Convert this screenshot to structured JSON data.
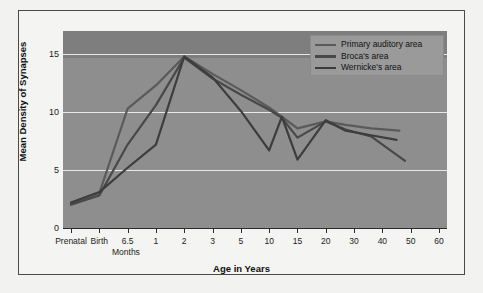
{
  "figure": {
    "background": "#f2f2f0",
    "border_color": "#4a4a4a"
  },
  "chart_data": {
    "type": "line",
    "title": "",
    "xlabel": "Age in Years",
    "ylabel": "Mean Density of Synapses",
    "secondary_xlabel": "Months",
    "plot_background": "#8e8e8e",
    "grid": true,
    "grid_color": "#e8e8e6",
    "legend_position": "top-right",
    "ylim": [
      0,
      17
    ],
    "yticks": [
      0,
      5,
      10,
      15
    ],
    "ytick_labels": [
      "0",
      "5",
      "10",
      "15"
    ],
    "categories": [
      "Prenatal",
      "Birth",
      "6.5",
      "1",
      "2",
      "3",
      "5",
      "10",
      "15",
      "20",
      "30",
      "40",
      "50",
      "60"
    ],
    "xtick_labels": [
      "Prenatal",
      "Birth",
      "6.5",
      "1",
      "2",
      "3",
      "5",
      "10",
      "15",
      "20",
      "30",
      "40",
      "50",
      "60"
    ],
    "series": [
      {
        "name": "Primary auditory area",
        "color": "#5a5a5a",
        "x": [
          0,
          1,
          2,
          3,
          4,
          5,
          6,
          7,
          7.45,
          8,
          9,
          9.7,
          10.6,
          11.6
        ],
        "values": [
          2.1,
          3.0,
          10.3,
          12.3,
          14.8,
          13.3,
          11.9,
          10.4,
          9.6,
          8.6,
          9.2,
          8.9,
          8.6,
          8.4
        ]
      },
      {
        "name": "Broca's area",
        "color": "#484848",
        "x": [
          0,
          1,
          2,
          3,
          4,
          5,
          6,
          7,
          7.45,
          8,
          9,
          9.7,
          10.6,
          11.8
        ],
        "values": [
          2.0,
          2.8,
          7.2,
          10.6,
          14.7,
          12.9,
          11.5,
          10.2,
          9.5,
          7.8,
          9.2,
          8.5,
          7.9,
          5.8
        ]
      },
      {
        "name": "Wernicke's area",
        "color": "#3d3d3d",
        "x": [
          0,
          1,
          2,
          3,
          4,
          5,
          6,
          7,
          7.45,
          8,
          9,
          9.7,
          10.6,
          11.5
        ],
        "values": [
          2.2,
          3.1,
          5.2,
          7.2,
          14.8,
          13.0,
          10.1,
          6.7,
          9.6,
          5.9,
          9.3,
          8.4,
          8.0,
          7.6
        ]
      }
    ]
  }
}
